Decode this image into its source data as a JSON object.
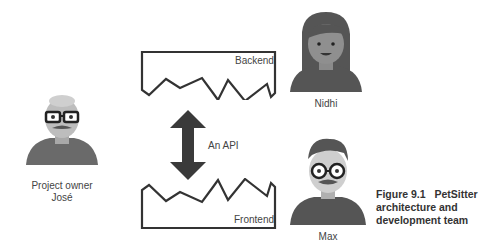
{
  "people": {
    "project_owner": {
      "role": "Project owner",
      "name": "José"
    },
    "backend_dev": {
      "name": "Nidhi"
    },
    "frontend_dev": {
      "name": "Max"
    }
  },
  "components": {
    "backend": {
      "label": "Backend"
    },
    "frontend": {
      "label": "Frontend"
    },
    "api": {
      "label": "An API"
    }
  },
  "caption": {
    "figure": "Figure 9.1",
    "title_line1": "PetSitter",
    "title_line2": "architecture and",
    "title_line3": "development team"
  },
  "colors": {
    "stroke": "#333333",
    "arrow": "#3a3a3a",
    "skin": "#bdbdbd",
    "hair": "#555555",
    "shirt": "#6a6a6a"
  }
}
